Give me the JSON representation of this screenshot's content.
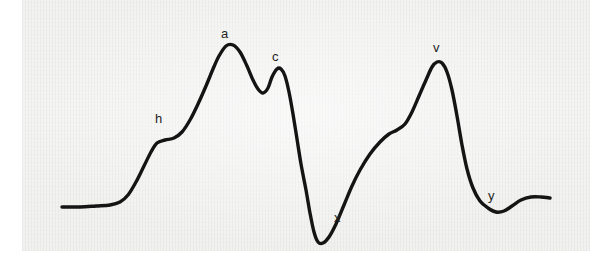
{
  "figure": {
    "background_color": "#ffffff",
    "panel_color": "#f3f3f2",
    "trace_color": "#141414",
    "label_color": "#232323",
    "panel": {
      "x": 22,
      "y": 0,
      "width": 568,
      "height": 251
    }
  },
  "labels": [
    {
      "text": "h",
      "x": 155,
      "y": 112
    },
    {
      "text": "a",
      "x": 221,
      "y": 27
    },
    {
      "text": "c",
      "x": 272,
      "y": 50
    },
    {
      "text": "x",
      "x": 334,
      "y": 211
    },
    {
      "text": "v",
      "x": 433,
      "y": 41
    },
    {
      "text": "y",
      "x": 488,
      "y": 189
    }
  ],
  "chart_data": {
    "type": "line",
    "subtitle": "",
    "xlabel": "",
    "ylabel": "",
    "grid": false,
    "legend": null,
    "xlim": [
      60,
      552
    ],
    "ylim": [
      245,
      40
    ],
    "annotations": [
      {
        "label": "h",
        "x": 163,
        "y": 140,
        "role": "h-plateau"
      },
      {
        "label": "a",
        "x": 226,
        "y": 45,
        "role": "a-wave-peak"
      },
      {
        "label": "c",
        "x": 277,
        "y": 68,
        "role": "c-wave-peak"
      },
      {
        "label": "x",
        "x": 318,
        "y": 242,
        "role": "x-descent-trough"
      },
      {
        "label": "v",
        "x": 437,
        "y": 62,
        "role": "v-wave-peak"
      },
      {
        "label": "y",
        "x": 500,
        "y": 212,
        "role": "y-descent-trough"
      }
    ],
    "series": [
      {
        "name": "JVP",
        "points": [
          [
            62,
            207
          ],
          [
            80,
            207
          ],
          [
            96,
            206
          ],
          [
            110,
            205
          ],
          [
            120,
            202
          ],
          [
            128,
            195
          ],
          [
            136,
            182
          ],
          [
            144,
            166
          ],
          [
            151,
            152
          ],
          [
            157,
            143
          ],
          [
            165,
            140
          ],
          [
            174,
            138
          ],
          [
            182,
            132
          ],
          [
            190,
            120
          ],
          [
            198,
            104
          ],
          [
            206,
            86
          ],
          [
            213,
            69
          ],
          [
            219,
            56
          ],
          [
            226,
            46
          ],
          [
            233,
            45
          ],
          [
            240,
            52
          ],
          [
            247,
            66
          ],
          [
            253,
            80
          ],
          [
            258,
            89
          ],
          [
            263,
            93
          ],
          [
            268,
            88
          ],
          [
            272,
            77
          ],
          [
            277,
            69
          ],
          [
            281,
            69
          ],
          [
            285,
            76
          ],
          [
            289,
            92
          ],
          [
            293,
            114
          ],
          [
            297,
            139
          ],
          [
            301,
            164
          ],
          [
            306,
            190
          ],
          [
            310,
            213
          ],
          [
            314,
            232
          ],
          [
            318,
            242
          ],
          [
            323,
            243
          ],
          [
            329,
            237
          ],
          [
            336,
            224
          ],
          [
            344,
            205
          ],
          [
            352,
            186
          ],
          [
            360,
            170
          ],
          [
            370,
            154
          ],
          [
            380,
            142
          ],
          [
            389,
            134
          ],
          [
            397,
            130
          ],
          [
            405,
            124
          ],
          [
            412,
            112
          ],
          [
            419,
            96
          ],
          [
            426,
            80
          ],
          [
            432,
            67
          ],
          [
            437,
            62
          ],
          [
            442,
            63
          ],
          [
            447,
            72
          ],
          [
            452,
            90
          ],
          [
            457,
            116
          ],
          [
            462,
            145
          ],
          [
            467,
            169
          ],
          [
            473,
            188
          ],
          [
            480,
            201
          ],
          [
            488,
            208
          ],
          [
            496,
            212
          ],
          [
            504,
            211
          ],
          [
            512,
            206
          ],
          [
            521,
            200
          ],
          [
            531,
            197
          ],
          [
            541,
            197
          ],
          [
            550,
            198
          ]
        ]
      }
    ]
  }
}
